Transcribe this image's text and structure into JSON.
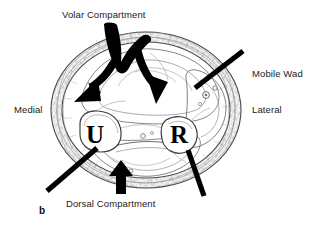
{
  "figure": {
    "id": "b",
    "type": "anatomical-cross-section",
    "background_color": "#ffffff",
    "ink_color": "#000000",
    "outline_color": "#5a5a5a"
  },
  "labels": {
    "volar_compartment": "Volar Compartment",
    "dorsal_compartment": "Dorsal Compartment",
    "mobile_wad": "Mobile Wad",
    "medial": "Medial",
    "lateral": "Lateral",
    "figure_letter": "b"
  },
  "bones": {
    "ulna": "U",
    "radius": "R"
  },
  "pointers": [
    {
      "name": "volar-forked-arrow",
      "style": "bifurcating-arrow",
      "heads": 2
    },
    {
      "name": "dorsal-arrow",
      "style": "arrow",
      "heads": 1
    },
    {
      "name": "mobile-wad-leader",
      "style": "plain-line",
      "heads": 0
    },
    {
      "name": "medial-leader",
      "style": "plain-line",
      "heads": 0
    },
    {
      "name": "lateral-lower-leader",
      "style": "plain-line",
      "heads": 0
    }
  ]
}
